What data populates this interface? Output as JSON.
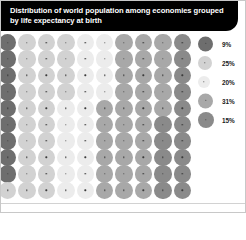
{
  "title": {
    "line1": "Distribution of world population among economies grouped",
    "line2": "by life expectancy at birth",
    "full": "Distribution of world population among economies grouped\nby life expectancy at birth",
    "background_color": "#000000",
    "text_color": "#ffffff"
  },
  "legend": {
    "position": "right",
    "items": [
      {
        "label": "9%",
        "value": 9,
        "color": "#6e6e6e",
        "size_px": 15
      },
      {
        "label": "25%",
        "value": 25,
        "color": "#d2d2d2",
        "size_px": 14
      },
      {
        "label": "20%",
        "value": 20,
        "color": "#ececec",
        "size_px": 12
      },
      {
        "label": "31%",
        "value": 31,
        "color": "#a8a8a8",
        "size_px": 15
      },
      {
        "label": "15%",
        "value": 15,
        "color": "#8a8a8a",
        "size_px": 16
      }
    ]
  },
  "chart_data": {
    "type": "waffle",
    "title": "Distribution of world population among economies grouped by life expectancy at birth",
    "subtitle": "",
    "xlabel": "",
    "ylabel": "",
    "unit": "percent of world population",
    "total": 100,
    "grid": {
      "columns": 10,
      "rows": 10,
      "dot_value": 1,
      "fill_order": "column-major"
    },
    "categories": [
      "9%",
      "25%",
      "20%",
      "31%",
      "15%"
    ],
    "values": [
      9,
      25,
      20,
      31,
      15
    ],
    "colors": [
      "#6e6e6e",
      "#d2d2d2",
      "#ececec",
      "#a8a8a8",
      "#8a8a8a"
    ],
    "series": [
      {
        "name": "group-1",
        "label": "9%",
        "value": 9,
        "dots": 9,
        "color": "#6e6e6e"
      },
      {
        "name": "group-2",
        "label": "25%",
        "value": 25,
        "dots": 25,
        "color": "#d2d2d2"
      },
      {
        "name": "group-3",
        "label": "20%",
        "value": 20,
        "dots": 20,
        "color": "#ececec"
      },
      {
        "name": "group-4",
        "label": "31%",
        "value": 31,
        "dots": 31,
        "color": "#a8a8a8"
      },
      {
        "name": "group-5",
        "label": "15%",
        "value": 15,
        "dots": 15,
        "color": "#8a8a8a"
      }
    ],
    "legend_position": "right",
    "grid_on": false
  }
}
